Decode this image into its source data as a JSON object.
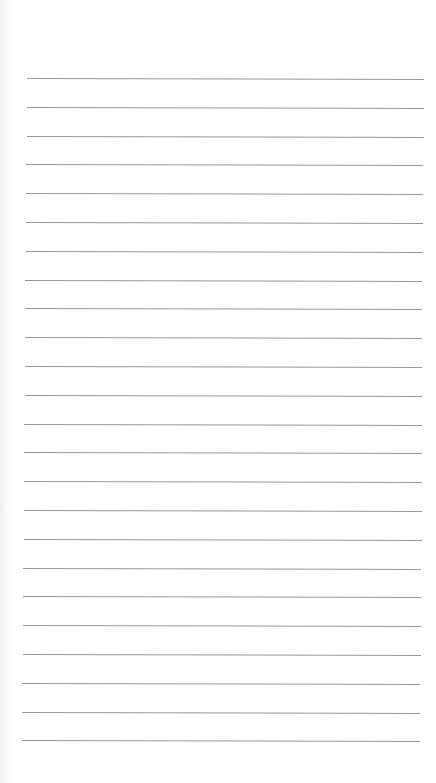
{
  "page": {
    "type": "lined-paper",
    "background_color": "#ffffff",
    "line_color": "#8d8d8d",
    "line_count": 24,
    "first_line_y": 78,
    "line_spacing": 28.8,
    "top_left_x": 27,
    "top_right_x": 424,
    "bottom_left_x": 22,
    "bottom_right_x": 420
  }
}
